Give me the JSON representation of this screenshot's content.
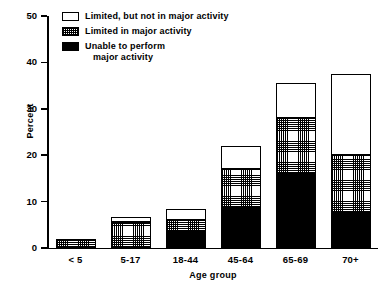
{
  "chart_data": {
    "type": "bar",
    "subtype": "stacked",
    "title": "",
    "xlabel": "Age group",
    "ylabel": "Percent",
    "categories": [
      "< 5",
      "5-17",
      "18-44",
      "45-64",
      "65-69",
      "70+"
    ],
    "ylim": [
      0,
      50
    ],
    "yticks": [
      0,
      10,
      20,
      30,
      40,
      50
    ],
    "ytick_labels": [
      "0",
      "10",
      "20",
      "30",
      "40",
      "50"
    ],
    "grid": false,
    "legend_position": "top-left-inside",
    "series": [
      {
        "name": "Unable to perform major activity",
        "fill": "black",
        "values": [
          0,
          0,
          3.5,
          8.6,
          16.0,
          7.5
        ]
      },
      {
        "name": "Limited in major activity",
        "fill": "hatch",
        "values": [
          2.0,
          5.5,
          2.5,
          8.4,
          12.0,
          12.5
        ]
      },
      {
        "name": "Limited, but not in major activity",
        "fill": "white",
        "values": [
          0,
          1.2,
          2.5,
          5.0,
          7.5,
          17.5
        ]
      }
    ],
    "totals": [
      2.0,
      6.7,
      8.5,
      22.0,
      35.5,
      37.5
    ]
  },
  "legend": {
    "items": [
      {
        "label": "Limited, but not in major activity",
        "fill": "white"
      },
      {
        "label": "Limited in major activity",
        "fill": "hatch"
      },
      {
        "label": "Unable to perform\n   major activity",
        "fill": "black"
      }
    ]
  }
}
